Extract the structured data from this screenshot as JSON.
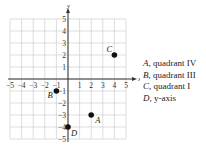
{
  "chart_data": {
    "type": "scatter",
    "title": "",
    "xlabel": "x",
    "ylabel": "y",
    "xlim": [
      -5,
      5
    ],
    "ylim": [
      -5,
      5
    ],
    "grid": true,
    "x_ticks": [
      -5,
      -4,
      -3,
      -2,
      -1,
      1,
      2,
      3,
      4,
      5
    ],
    "y_ticks": [
      -5,
      -4,
      -3,
      -2,
      -1,
      1,
      2,
      3,
      4,
      5
    ],
    "points": [
      {
        "label": "A",
        "x": 2,
        "y": -3
      },
      {
        "label": "B",
        "x": -1,
        "y": -1
      },
      {
        "label": "C",
        "x": 4,
        "y": 2
      },
      {
        "label": "D",
        "x": 0,
        "y": -4
      }
    ],
    "colors": {
      "grid": "#cfcfcf",
      "axis": "#333333",
      "point": "#111111"
    }
  },
  "answers": [
    {
      "letter": "A",
      "text": ", quadrant IV"
    },
    {
      "letter": "B",
      "text": ", quadrant III"
    },
    {
      "letter": "C",
      "text": ", quadrant I"
    },
    {
      "letter": "D",
      "text": ", y-axis"
    }
  ]
}
